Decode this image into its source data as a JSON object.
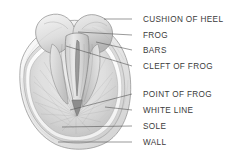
{
  "figure": {
    "background_color": "#ffffff",
    "text_color": "#3b3b3b",
    "leader_line_color": "#555555",
    "illustration": {
      "name": "hoof-sole-illustration",
      "style": "grayscale pencil shading",
      "view": "sole (bottom) view of horse hoof"
    }
  },
  "labels": [
    {
      "id": "cushion-of-heel",
      "text": "CUSHION OF HEEL",
      "x": 143,
      "y": 15,
      "leader": {
        "x1": 132,
        "y1": 19,
        "x2": 104,
        "y2": 19
      }
    },
    {
      "id": "frog",
      "text": "FROG",
      "x": 143,
      "y": 31,
      "leader": {
        "x1": 132,
        "y1": 35,
        "x2": 78,
        "y2": 32
      }
    },
    {
      "id": "bars",
      "text": "BARS",
      "x": 143,
      "y": 46,
      "leader": {
        "x1": 132,
        "y1": 50,
        "x2": 96,
        "y2": 42
      }
    },
    {
      "id": "cleft-of-frog",
      "text": "CLEFT OF FROG",
      "x": 143,
      "y": 62,
      "leader": {
        "x1": 132,
        "y1": 66,
        "x2": 66,
        "y2": 46
      }
    },
    {
      "id": "point-of-frog",
      "text": "POINT OF FROG",
      "x": 143,
      "y": 90,
      "leader": {
        "x1": 132,
        "y1": 94,
        "x2": 70,
        "y2": 110
      }
    },
    {
      "id": "white-line",
      "text": "WHITE LINE",
      "x": 143,
      "y": 106,
      "leader": {
        "x1": 132,
        "y1": 110,
        "x2": 105,
        "y2": 107
      }
    },
    {
      "id": "sole",
      "text": "SOLE",
      "x": 143,
      "y": 122,
      "leader": {
        "x1": 132,
        "y1": 126,
        "x2": 62,
        "y2": 127
      }
    },
    {
      "id": "wall",
      "text": "WALL",
      "x": 143,
      "y": 138,
      "leader": {
        "x1": 132,
        "y1": 142,
        "x2": 58,
        "y2": 142
      }
    }
  ]
}
